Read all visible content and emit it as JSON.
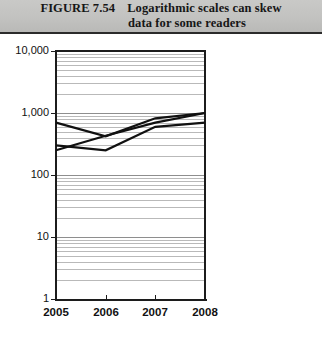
{
  "header": {
    "figure_number": "FIGURE 7.54",
    "title_line1": "Logarithmic scales can skew",
    "title_line2": "data for some readers",
    "background_color": "#c2c2c0",
    "text_color": "#161616"
  },
  "chart_data": {
    "type": "line",
    "title": "Logarithmic scales can skew data for some readers",
    "xlabel": "",
    "ylabel": "",
    "x": [
      "2005",
      "2006",
      "2007",
      "2008"
    ],
    "categories": [
      "2005",
      "2006",
      "2007",
      "2008"
    ],
    "yscale": "log",
    "ylim": [
      1,
      10000
    ],
    "ytick_labels": [
      "10,000",
      "1,000",
      "100",
      "10",
      "1"
    ],
    "ytick_values": [
      10000,
      1000,
      100,
      10,
      1
    ],
    "grid": "horizontal-minor-log",
    "legend": "none",
    "series": [
      {
        "name": "Series 1",
        "values": [
          700,
          420,
          820,
          1000
        ]
      },
      {
        "name": "Series 2",
        "values": [
          300,
          250,
          600,
          700
        ]
      },
      {
        "name": "Series 3",
        "values": [
          250,
          430,
          700,
          1000
        ]
      }
    ],
    "line_color": "#111111",
    "gridline_color": "#b9b9b9"
  },
  "axes": {
    "y_labels": [
      "10,000",
      "1,000",
      "100",
      "10",
      "1"
    ],
    "x_labels": [
      "2005",
      "2006",
      "2007",
      "2008"
    ]
  }
}
